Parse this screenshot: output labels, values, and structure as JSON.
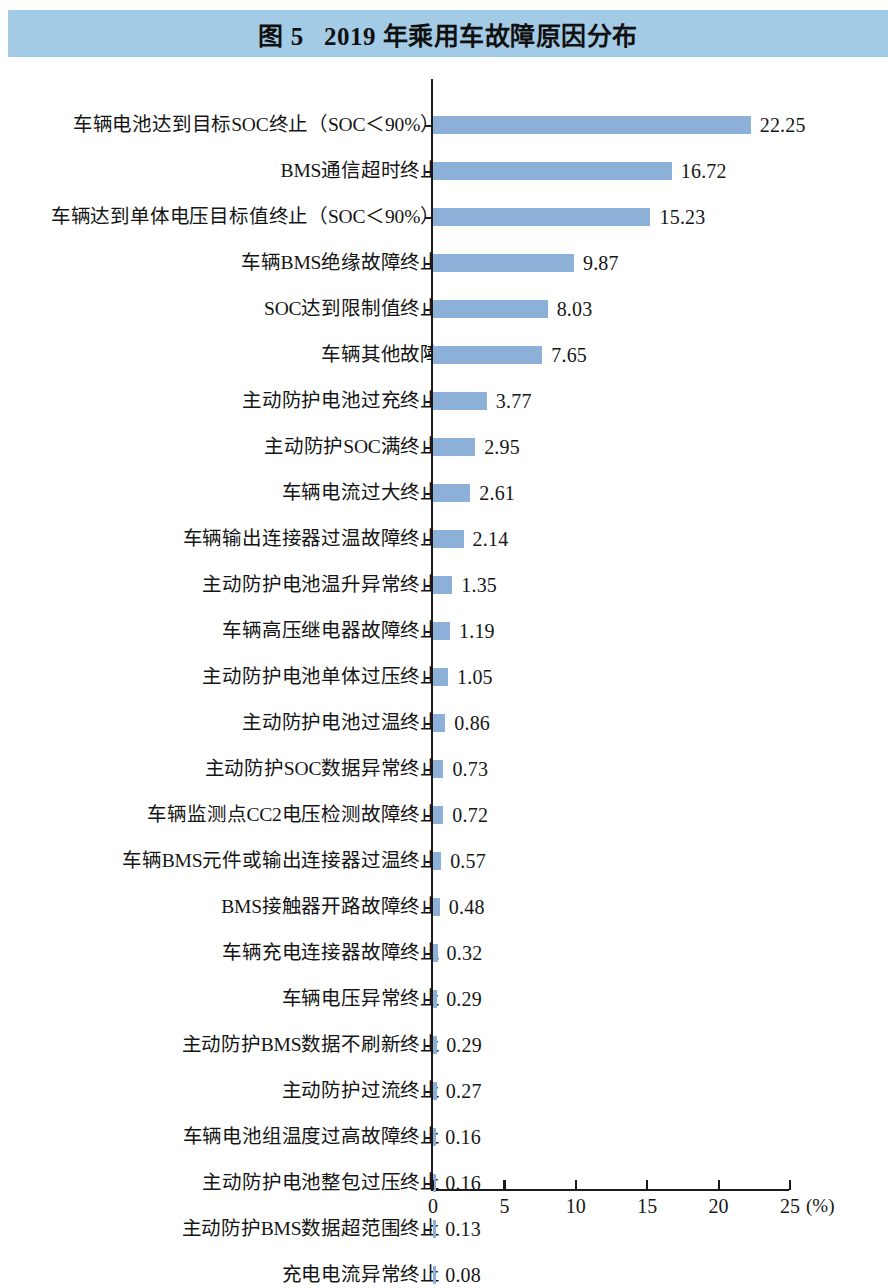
{
  "figure": {
    "title": "图 5   2019 年乘用车故障原因分布",
    "band_color": "#a3cbe5",
    "bar_color": "#8cb0d7"
  },
  "chart_data": {
    "type": "bar",
    "orientation": "horizontal",
    "title": "图 5   2019 年乘用车故障原因分布",
    "xlabel": "(%)",
    "ylabel": "",
    "xlim": [
      0,
      25
    ],
    "xticks": [
      0,
      5,
      10,
      15,
      20,
      25
    ],
    "xtick_labels": [
      "0",
      "5",
      "10",
      "15",
      "20",
      "25"
    ],
    "unit": "(%)",
    "grid": false,
    "legend": null,
    "categories": [
      "车辆电池达到目标SOC终止（SOC＜90%）",
      "BMS通信超时终止",
      "车辆达到单体电压目标值终止（SOC＜90%）",
      "车辆BMS绝缘故障终止",
      "SOC达到限制值终止",
      "车辆其他故障",
      "主动防护电池过充终止",
      "主动防护SOC满终止",
      "车辆电流过大终止",
      "车辆输出连接器过温故障终止",
      "主动防护电池温升异常终止",
      "车辆高压继电器故障终止",
      "主动防护电池单体过压终止",
      "主动防护电池过温终止",
      "主动防护SOC数据异常终止",
      "车辆监测点CC2电压检测故障终止",
      "车辆BMS元件或输出连接器过温终止",
      "BMS接触器开路故障终止",
      "车辆充电连接器故障终止",
      "车辆电压异常终止",
      "主动防护BMS数据不刷新终止",
      "主动防护过流终止",
      "车辆电池组温度过高故障终止",
      "主动防护电池整包过压终止",
      "主动防护BMS数据超范围终止",
      "充电电流异常终止"
    ],
    "values": [
      22.25,
      16.72,
      15.23,
      9.87,
      8.03,
      7.65,
      3.77,
      2.95,
      2.61,
      2.14,
      1.35,
      1.19,
      1.05,
      0.86,
      0.73,
      0.72,
      0.57,
      0.48,
      0.32,
      0.29,
      0.29,
      0.27,
      0.16,
      0.16,
      0.13,
      0.08
    ],
    "value_labels": [
      "22.25",
      "16.72",
      "15.23",
      "9.87",
      "8.03",
      "7.65",
      "3.77",
      "2.95",
      "2.61",
      "2.14",
      "1.35",
      "1.19",
      "1.05",
      "0.86",
      "0.73",
      "0.72",
      "0.57",
      "0.48",
      "0.32",
      "0.29",
      "0.29",
      "0.27",
      "0.16",
      "0.16",
      "0.13",
      "0.08"
    ]
  }
}
